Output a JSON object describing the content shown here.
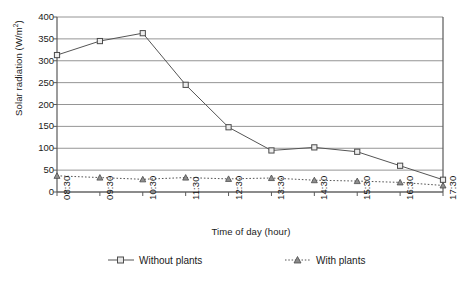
{
  "chart_data": {
    "type": "line",
    "title": "",
    "xlabel": "Time of day (hour)",
    "ylabel": "Solar radiation (W/m²)",
    "categories": [
      "08:30",
      "09:30",
      "10:30",
      "11:30",
      "12:30",
      "13:30",
      "14:30",
      "15:30",
      "16:30",
      "17:30"
    ],
    "ylim": [
      0,
      400
    ],
    "yticks": [
      0,
      50,
      100,
      150,
      200,
      250,
      300,
      350,
      400
    ],
    "grid": "horizontal",
    "legend_position": "bottom",
    "series": [
      {
        "name": "Without plants",
        "marker": "square",
        "linestyle": "solid",
        "color": "#555555",
        "values": [
          313,
          345,
          363,
          245,
          148,
          95,
          102,
          92,
          60,
          28
        ]
      },
      {
        "name": "With plants",
        "marker": "triangle",
        "linestyle": "dotted",
        "color": "#555555",
        "values": [
          37,
          33,
          29,
          33,
          30,
          32,
          27,
          25,
          22,
          15
        ]
      }
    ]
  },
  "axis": {
    "y_title_main": "Solar radiation (W/m",
    "y_title_sup": "2",
    "y_title_end": ")",
    "x_title": "Time of day (hour)"
  },
  "legend": {
    "items": [
      {
        "label": "Without plants",
        "key": "square-solid-line-key"
      },
      {
        "label": "With plants",
        "key": "triangle-dotted-line-key"
      }
    ]
  }
}
